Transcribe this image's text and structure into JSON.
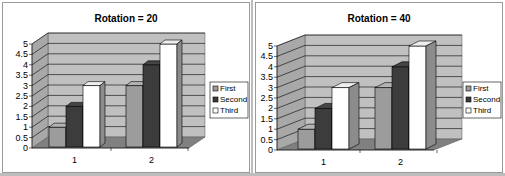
{
  "chart_data": [
    {
      "type": "bar",
      "title": "Rotation = 20",
      "categories": [
        "1",
        "2"
      ],
      "series": [
        {
          "name": "First",
          "values": [
            1,
            3
          ],
          "color": "#9c9c9c"
        },
        {
          "name": "Second",
          "values": [
            2,
            4
          ],
          "color": "#3c3c3c"
        },
        {
          "name": "Third",
          "values": [
            3,
            5
          ],
          "color": "#ffffff"
        }
      ],
      "yticks": [
        "0",
        "0.5",
        "1",
        "1.5",
        "2",
        "2.5",
        "3",
        "3.5",
        "4",
        "4.5",
        "5"
      ],
      "ylim": [
        0,
        5
      ],
      "xlabel": "",
      "ylabel": "",
      "grid": true,
      "legend": "right",
      "rotation": 20
    },
    {
      "type": "bar",
      "title": "Rotation = 40",
      "categories": [
        "1",
        "2"
      ],
      "series": [
        {
          "name": "First",
          "values": [
            1,
            3
          ],
          "color": "#9c9c9c"
        },
        {
          "name": "Second",
          "values": [
            2,
            4
          ],
          "color": "#3c3c3c"
        },
        {
          "name": "Third",
          "values": [
            3,
            5
          ],
          "color": "#ffffff"
        }
      ],
      "yticks": [
        "0",
        "0.5",
        "1",
        "1.5",
        "2",
        "2.5",
        "3",
        "3.5",
        "4",
        "4.5",
        "5"
      ],
      "ylim": [
        0,
        5
      ],
      "xlabel": "",
      "ylabel": "",
      "grid": true,
      "legend": "right",
      "rotation": 40
    }
  ],
  "colors": {
    "wall": "#c0c0c0",
    "floor": "#808080",
    "gridline": "#000000"
  }
}
